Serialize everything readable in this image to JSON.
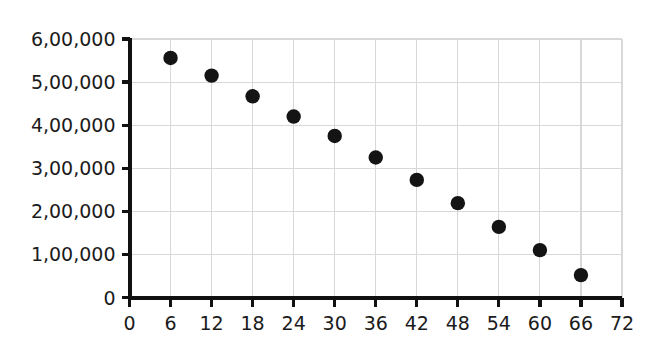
{
  "chart_data": {
    "type": "scatter",
    "title": "",
    "xlabel": "",
    "ylabel": "",
    "xlim": [
      0,
      72
    ],
    "ylim": [
      0,
      600000
    ],
    "grid": true,
    "legend": false,
    "marker": "filled-circle",
    "marker_color": "#141414",
    "grid_color": "#d8d8d8",
    "axis_color": "#111111",
    "x": [
      6,
      12,
      18,
      24,
      30,
      36,
      42,
      48,
      54,
      60,
      66
    ],
    "values": [
      556000,
      515000,
      467000,
      420000,
      375000,
      325000,
      273000,
      219000,
      164000,
      110000,
      52000
    ],
    "points": [
      {
        "x": 6,
        "y": 556000
      },
      {
        "x": 12,
        "y": 515000
      },
      {
        "x": 18,
        "y": 467000
      },
      {
        "x": 24,
        "y": 420000
      },
      {
        "x": 30,
        "y": 375000
      },
      {
        "x": 36,
        "y": 325000
      },
      {
        "x": 42,
        "y": 273000
      },
      {
        "x": 48,
        "y": 219000
      },
      {
        "x": 54,
        "y": 164000
      },
      {
        "x": 60,
        "y": 110000
      },
      {
        "x": 66,
        "y": 52000
      }
    ],
    "xticks": [
      0,
      6,
      12,
      18,
      24,
      30,
      36,
      42,
      48,
      54,
      60,
      66,
      72
    ],
    "xtick_labels": [
      "0",
      "6",
      "12",
      "18",
      "24",
      "30",
      "36",
      "42",
      "48",
      "54",
      "60",
      "66",
      "72"
    ],
    "yticks": [
      0,
      100000,
      200000,
      300000,
      400000,
      500000,
      600000
    ],
    "ytick_labels": [
      "0",
      "1,00,000",
      "2,00,000",
      "3,00,000",
      "4,00,000",
      "5,00,000",
      "6,00,000"
    ]
  }
}
